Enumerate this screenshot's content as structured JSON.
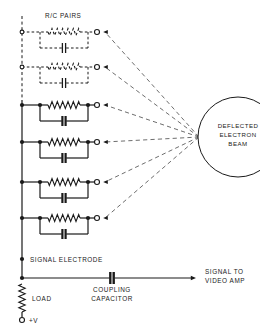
{
  "figure": {
    "kind": "schematic-diagram",
    "background_color": "#ffffff",
    "line_color": "#1a1a1a",
    "beam_line_color": "#6e6e6e",
    "text_color": "#1a1a1a"
  },
  "labels": {
    "rc_pairs": "R/C PAIRS",
    "beam_line1": "DEFLECTED",
    "beam_line2": "ELECTRON",
    "beam_line3": "BEAM",
    "signal_electrode": "SIGNAL ELECTRODE",
    "coupling_line1": "COUPLING",
    "coupling_line2": "CAPACITOR",
    "load": "LOAD",
    "supply": "+V",
    "output_line1": "SIGNAL TO",
    "output_line2": "VIDEO AMP"
  },
  "bus": {
    "x": 22,
    "dashed_top_y": 16,
    "dashed_bottom_y": 100,
    "solid_top_y": 100,
    "solid_bottom_y": 278,
    "style_top": "dashed",
    "style_bottom": "solid"
  },
  "branches": [
    {
      "index": 1,
      "y": 32,
      "style": "dashed",
      "node": "open-circle",
      "terminal": "open-circle"
    },
    {
      "index": 2,
      "y": 67,
      "style": "dashed",
      "node": "open-circle",
      "terminal": "open-circle"
    },
    {
      "index": 3,
      "y": 105,
      "style": "solid",
      "node": "filled-dot",
      "terminal": "open-circle"
    },
    {
      "index": 4,
      "y": 142,
      "style": "solid",
      "node": "filled-dot",
      "terminal": "open-circle"
    },
    {
      "index": 5,
      "y": 182,
      "style": "solid",
      "node": "filled-dot",
      "terminal": "open-circle"
    },
    {
      "index": 6,
      "y": 218,
      "style": "solid",
      "node": "filled-dot",
      "terminal": "open-circle"
    }
  ],
  "branch_geometry": {
    "left_x": 40,
    "right_x": 88,
    "terminal_x": 97,
    "resistor_start_x": 48,
    "resistor_end_x": 80,
    "resistor_zigzags": 6,
    "cap_drop": 16,
    "cap_gap": 3.2,
    "cap_plate_half_height": 5
  },
  "beam": {
    "circle_cx": 238,
    "circle_cy": 137,
    "circle_r": 40,
    "origin_x": 199,
    "origin_y": 137,
    "ray_count": 6,
    "arrowheads": true
  },
  "output_bus": {
    "y": 278,
    "start_x": 22,
    "end_x": 196,
    "arrow": true,
    "capacitor_x": 112,
    "capacitor_gap": 3.4,
    "capacitor_plate_half_height": 6
  },
  "signal_electrode_marker": {
    "x": 22,
    "y": 259,
    "node": "filled-dot"
  },
  "load_resistor": {
    "x": 22,
    "top_y": 284,
    "bottom_y": 312,
    "zigzags": 5,
    "terminal_y": 320,
    "terminal": "open-circle"
  },
  "colors": {
    "ink": "#1a1a1a",
    "beam": "#6e6e6e",
    "paper": "#ffffff"
  }
}
